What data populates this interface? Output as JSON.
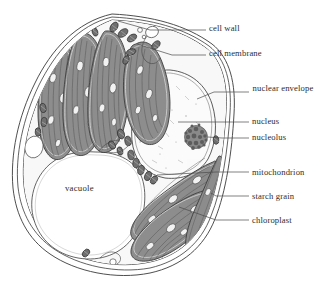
{
  "figure": {
    "kind": "biology-diagram",
    "background_color": "#ffffff",
    "line_color": "#3a3a3a"
  },
  "palette": {
    "outline": "#3a3a3a",
    "chloroplast_fill": "#8d8d8d",
    "chloroplast_stroke": "#4a4a4a",
    "thylakoid_line": "#4f4f4f",
    "starch_grain_fill": "#f2f2f2",
    "nucleus_fill": "#fbfbfb",
    "nucleolus_fill": "#7d7d7d",
    "vacuole_fill": "#ffffff",
    "mitochondrion_fill": "#6f6f6f",
    "cytoplasm_fill": "#f7f7f7",
    "leader_line": "#4a4a4a",
    "text": "#2d2d2d"
  },
  "labels": {
    "external": [
      {
        "id": "cell-wall",
        "text": "cell wall",
        "x": 209,
        "y": 24,
        "lines": 1
      },
      {
        "id": "cell-membrane",
        "text": "cell membrane",
        "x": 209,
        "y": 49,
        "lines": 1
      },
      {
        "id": "nuclear-envelope",
        "text": "nuclear envelope",
        "x": 252,
        "y": 84,
        "lines": 2
      },
      {
        "id": "nucleus",
        "text": "nucleus",
        "x": 252,
        "y": 117,
        "lines": 1
      },
      {
        "id": "nucleolus",
        "text": "nucleolus",
        "x": 252,
        "y": 133,
        "lines": 1
      },
      {
        "id": "mitochondrion",
        "text": "mitochondrion",
        "x": 252,
        "y": 168,
        "lines": 1
      },
      {
        "id": "starch-grain",
        "text": "starch grain",
        "x": 252,
        "y": 192,
        "lines": 1
      },
      {
        "id": "chloroplast",
        "text": "chloroplast",
        "x": 252,
        "y": 216,
        "lines": 1
      }
    ],
    "internal": [
      {
        "id": "vacuole",
        "text": "vacuole",
        "x": 65,
        "y": 183
      }
    ]
  },
  "leaders": [
    {
      "id": "leader-cell-wall",
      "d": "M 206 30 L 150 30 L 118 22"
    },
    {
      "id": "leader-cell-membrane",
      "d": "M 206 55 L 172 55 L 138 44"
    },
    {
      "id": "leader-nuclear-envelope",
      "d": "M 249 92 L 214 92 L 196 99"
    },
    {
      "id": "leader-nucleus",
      "d": "M 249 122 L 178 122"
    },
    {
      "id": "leader-nucleolus",
      "d": "M 249 138 L 224 138 L 206 137"
    },
    {
      "id": "leader-mitochondrion",
      "d": "M 249 172 L 216 172 L 156 174"
    },
    {
      "id": "leader-starch-grain",
      "d": "M 249 196 L 216 196 L 212 192"
    },
    {
      "id": "leader-chloroplast",
      "d": "M 249 220 L 216 220 L 178 207"
    }
  ],
  "structures": {
    "cell_wall_layers": 3,
    "chloroplast_count_upper": 4,
    "chloroplast_count_lower": 3,
    "mitochondrion_count": 22,
    "starch_grain_count": 14,
    "nucleolus_granules": 28
  }
}
